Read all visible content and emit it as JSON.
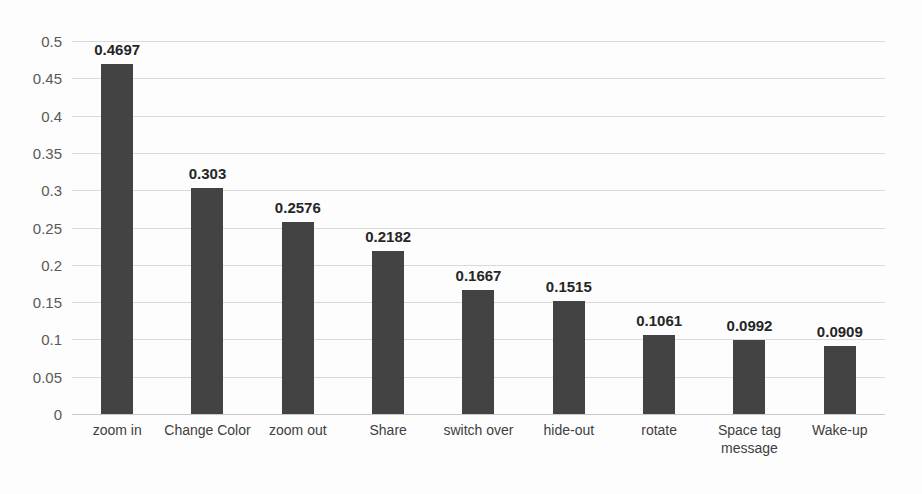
{
  "chart_data": {
    "type": "bar",
    "title": "",
    "subtitle": "",
    "xlabel": "",
    "ylabel": "",
    "ylim": [
      0,
      0.5
    ],
    "ytick_labels": [
      "0.5",
      "0.45",
      "0.4",
      "0.35",
      "0.3",
      "0.25",
      "0.2",
      "0.15",
      "0.1",
      "0.05",
      "0"
    ],
    "ytick_values": [
      0.5,
      0.45,
      0.4,
      0.35,
      0.3,
      0.25,
      0.2,
      0.15,
      0.1,
      0.05,
      0
    ],
    "grid": true,
    "legend": "none",
    "bar_color": "#434343",
    "categories": [
      "zoom in",
      "Change Color",
      "zoom out",
      "Share",
      "switch over",
      "hide-out",
      "rotate",
      "Space tag message",
      "Wake-up"
    ],
    "values": [
      0.4697,
      0.303,
      0.2576,
      0.2182,
      0.1667,
      0.1515,
      0.1061,
      0.0992,
      0.0909
    ],
    "data_labels": [
      "0.4697",
      "0.303",
      "0.2576",
      "0.2182",
      "0.1667",
      "0.1515",
      "0.1061",
      "0.0992",
      "0.0909"
    ]
  }
}
